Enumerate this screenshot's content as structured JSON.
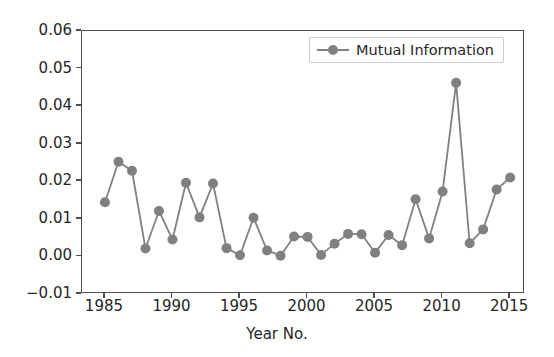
{
  "chart_data": {
    "type": "line",
    "title": "",
    "xlabel": "Year No.",
    "ylabel": "",
    "grid": false,
    "legend_position": "upper right",
    "xlim": [
      1983.3,
      2016.1
    ],
    "ylim": [
      -0.01,
      0.06
    ],
    "xticks": [
      1985,
      1990,
      1995,
      2000,
      2005,
      2010,
      2015
    ],
    "xtick_labels": [
      "1985",
      "1990",
      "1995",
      "2000",
      "2005",
      "2010",
      "2015"
    ],
    "yticks": [
      -0.01,
      0.0,
      0.01,
      0.02,
      0.03,
      0.04,
      0.05,
      0.06
    ],
    "ytick_labels": [
      "-0.01",
      "0.00",
      "0.01",
      "0.02",
      "0.03",
      "0.04",
      "0.05",
      "0.06"
    ],
    "x": [
      1985,
      1986,
      1987,
      1988,
      1989,
      1990,
      1991,
      1992,
      1993,
      1994,
      1995,
      1996,
      1997,
      1998,
      1999,
      2000,
      2001,
      2002,
      2003,
      2004,
      2005,
      2006,
      2007,
      2008,
      2009,
      2010,
      2011,
      2012,
      2013,
      2014,
      2015
    ],
    "series": [
      {
        "name": "Mutual Information",
        "color": "#808080",
        "marker": "circle",
        "values": [
          0.0144,
          0.0252,
          0.0228,
          0.0021,
          0.0121,
          0.0045,
          0.0196,
          0.0104,
          0.0194,
          0.0022,
          0.0003,
          0.0103,
          0.0016,
          0.0002,
          0.0053,
          0.0052,
          0.0004,
          0.0034,
          0.006,
          0.0059,
          0.001,
          0.0057,
          0.003,
          0.0152,
          0.0048,
          0.0173,
          0.0462,
          0.0035,
          0.0072,
          0.0178,
          0.021
        ]
      }
    ]
  },
  "legend": {
    "label": "Mutual Information"
  },
  "axis": {
    "xlabel": "Year No."
  }
}
